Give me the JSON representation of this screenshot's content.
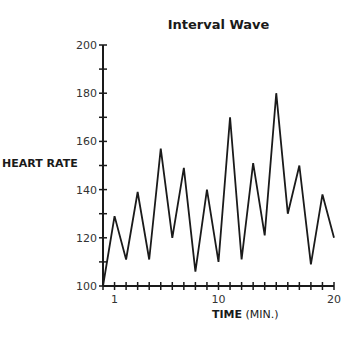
{
  "chart_data": {
    "type": "line",
    "title": "Interval Wave",
    "xlabel": "TIME (MIN.)",
    "xlabel_bold": "TIME",
    "xlabel_unit": "(MIN.)",
    "ylabel": "HEART RATE",
    "x": [
      0,
      1,
      2,
      3,
      4,
      5,
      6,
      7,
      8,
      9,
      10,
      11,
      12,
      13,
      14,
      15,
      16,
      17,
      18,
      19,
      20
    ],
    "series": [
      {
        "name": "Heart Rate",
        "values": [
          100,
          129,
          111,
          139,
          111,
          157,
          120,
          149,
          106,
          140,
          110,
          170,
          111,
          151,
          121,
          180,
          130,
          150,
          109,
          138,
          120
        ]
      }
    ],
    "xlim": [
      0,
      20
    ],
    "ylim": [
      100,
      200
    ],
    "x_tick_labels": [
      "1",
      "10",
      "20"
    ],
    "x_tick_label_positions": [
      1,
      10,
      20
    ],
    "y_tick_labels": [
      "100",
      "120",
      "140",
      "160",
      "180",
      "200"
    ],
    "y_minor_step": 10,
    "grid": false,
    "legend": "none"
  }
}
